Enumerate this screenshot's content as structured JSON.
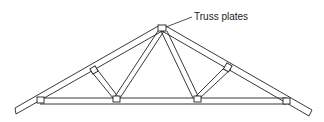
{
  "diagram": {
    "callout_label": "Truss plates",
    "stroke_color": "#222222",
    "background": "#ffffff"
  }
}
